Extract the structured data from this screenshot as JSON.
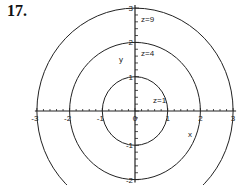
{
  "problem_number": "17.",
  "chart_data": {
    "type": "contour",
    "title": "",
    "xlabel": "x",
    "ylabel": "y",
    "x_ticks": [
      "-3",
      "-2",
      "-1",
      "0",
      "1",
      "2",
      "3"
    ],
    "y_ticks": [
      "-2",
      "-1",
      "0",
      "1",
      "2",
      "3"
    ],
    "xlim": [
      -3,
      3
    ],
    "ylim": [
      -2,
      3
    ],
    "grid": false,
    "contours": [
      {
        "label": "z=1",
        "level": 1,
        "radius": 1
      },
      {
        "label": "z=4",
        "level": 4,
        "radius": 2
      },
      {
        "label": "z=9",
        "level": 9,
        "radius": 3
      }
    ],
    "function": "z = x^2 + y^2"
  },
  "colors": {
    "line": "#222222",
    "background": "#ffffff"
  }
}
